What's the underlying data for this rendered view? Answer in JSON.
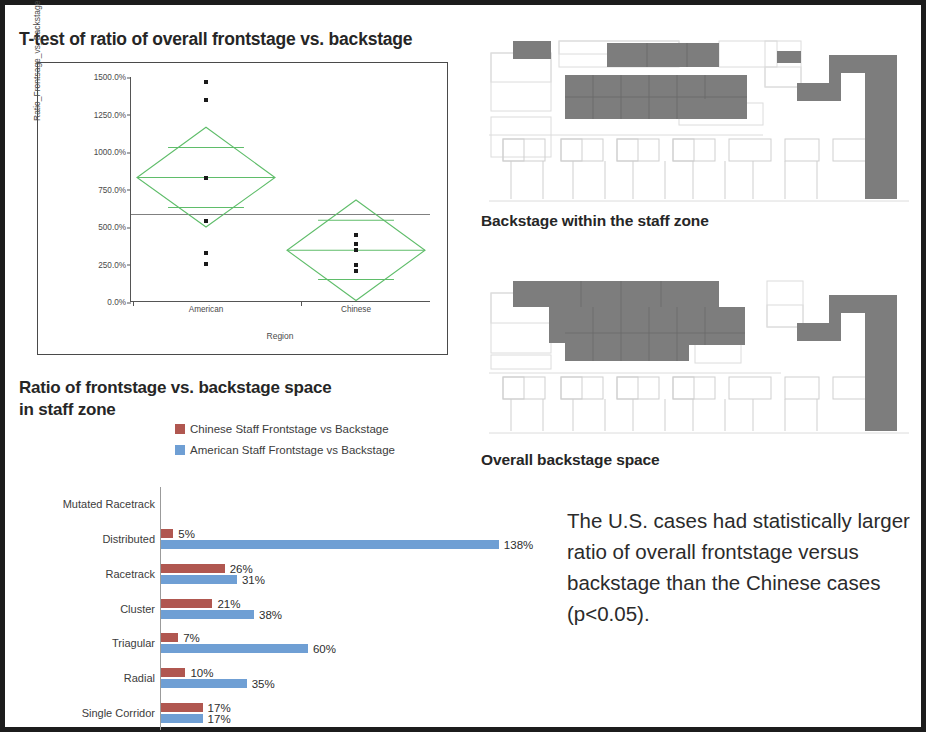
{
  "slide": {
    "frame_color": "#1c1c1c",
    "background": "#ffffff"
  },
  "ttest": {
    "title": "T-test of ratio of overall frontstage vs. backstage"
  },
  "bar_section": {
    "title": "Ratio of frontstage vs. backstage space in staff zone"
  },
  "floorplans": [
    {
      "caption": "Backstage within the staff zone"
    },
    {
      "caption": "Overall backstage space"
    }
  ],
  "conclusion": {
    "text": "The U.S. cases had statistically larger ratio of overall frontstage versus backstage  than the Chinese cases (p<0.05)."
  },
  "colors": {
    "chinese_bar": "#b05750",
    "american_bar": "#6f9fd4",
    "diamond_green": "#5fbd6a",
    "grand_mean_line": "#808080",
    "plan_fill": "#7d7d7d",
    "plan_outline": "#d8d8d8"
  },
  "chart_data": [
    {
      "type": "scatter",
      "name": "ttest-oneway-diamond-plot",
      "title": "T-test of ratio of overall frontstage vs. backstage",
      "xlabel": "Region",
      "ylabel": "Ratio_Frontsage_vs_Backstage",
      "categories": [
        "American",
        "Chinese"
      ],
      "ylim": [
        0,
        1500
      ],
      "yunit": "%",
      "yticks": [
        0,
        250,
        500,
        750,
        1000,
        1250,
        1500
      ],
      "ytick_labels": [
        "0.0%",
        "250.0%",
        "500.0%",
        "750.0%",
        "1000.0%",
        "1250.0%",
        "1500.0%"
      ],
      "grid": false,
      "legend": "none",
      "grand_mean": 590,
      "groups": [
        {
          "name": "American",
          "points": [
            1470,
            1345,
            830,
            540,
            330,
            255
          ],
          "mean": 830,
          "diamond_top": 1165,
          "diamond_bottom": 500,
          "overlap_top": 1030,
          "overlap_bottom": 630
        },
        {
          "name": "Chinese",
          "points": [
            450,
            385,
            345,
            250,
            205
          ],
          "mean": 345,
          "diamond_top": 680,
          "diamond_bottom": 10,
          "overlap_top": 545,
          "overlap_bottom": 150
        }
      ]
    },
    {
      "type": "bar",
      "name": "frontstage-backstage-ratio-bars",
      "orientation": "horizontal",
      "title": "Ratio of frontstage vs. backstage space in staff zone",
      "xlabel": "",
      "ylabel": "",
      "grid": false,
      "legend_position": "top",
      "xmax": 145,
      "categories": [
        "Mutated Racetrack",
        "Distributed",
        "Racetrack",
        "Cluster",
        "Triagular",
        "Radial",
        "Single Corridor"
      ],
      "series": [
        {
          "name": "Chinese Staff Frontstage vs Backstage",
          "color": "#b05750",
          "values": [
            null,
            5,
            26,
            21,
            7,
            10,
            17
          ],
          "labels": [
            "",
            "5%",
            "26%",
            "21%",
            "7%",
            "10%",
            "17%"
          ]
        },
        {
          "name": "American Staff Frontstage vs Backstage",
          "color": "#6f9fd4",
          "values": [
            null,
            138,
            31,
            38,
            60,
            35,
            17
          ],
          "labels": [
            "",
            "138%",
            "31%",
            "38%",
            "60%",
            "35%",
            "17%"
          ]
        }
      ]
    }
  ]
}
